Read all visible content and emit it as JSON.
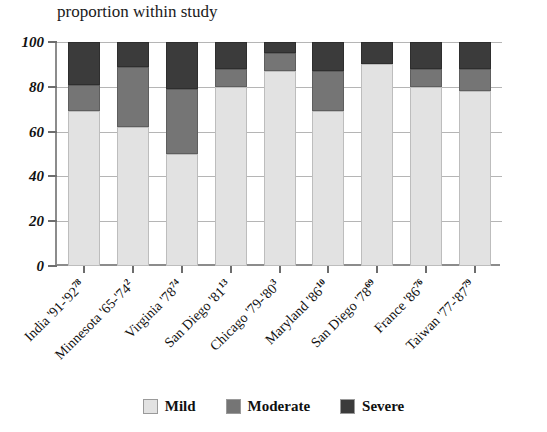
{
  "chart_data": {
    "type": "bar",
    "subtype": "stacked-bar-100",
    "title": "proportion within study",
    "xlabel": "",
    "ylabel": "",
    "ylim": [
      0,
      100
    ],
    "yticks": [
      0,
      20,
      40,
      60,
      80,
      100
    ],
    "grid": true,
    "legend_position": "bottom",
    "categories": [
      "India '91-'92",
      "Minnesota '65-'74",
      "Virginia '78",
      "San Diego '81",
      "Chicago '79-'80",
      "Maryland '86",
      "San Diego '78",
      "France '86",
      "Taiwan '77-'87"
    ],
    "category_refs": [
      "78",
      "2",
      "74",
      "13",
      "3",
      "10",
      "69",
      "76",
      "79"
    ],
    "series": [
      {
        "name": "Mild",
        "color": "#e2e2e2",
        "values": [
          69,
          62,
          50,
          80,
          87,
          69,
          90,
          80,
          78
        ]
      },
      {
        "name": "Moderate",
        "color": "#757575",
        "values": [
          12,
          27,
          29,
          8,
          8,
          18,
          0,
          8,
          10
        ]
      },
      {
        "name": "Severe",
        "color": "#3b3b3b",
        "values": [
          19,
          11,
          21,
          12,
          5,
          13,
          10,
          12,
          12
        ]
      }
    ]
  },
  "legend": {
    "items": [
      {
        "label": "Mild",
        "color": "#e2e2e2"
      },
      {
        "label": "Moderate",
        "color": "#757575"
      },
      {
        "label": "Severe",
        "color": "#3b3b3b"
      }
    ]
  },
  "axis": {
    "y_tick_labels": [
      "100",
      "80",
      "60",
      "40",
      "20",
      "0"
    ]
  }
}
